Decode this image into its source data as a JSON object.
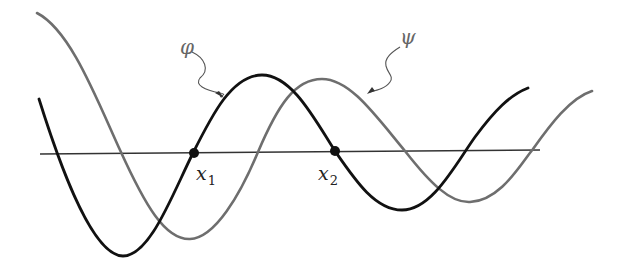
{
  "figure": {
    "colors": {
      "phi": "#111111",
      "psi": "#6e6e6e",
      "axis": "#333333",
      "background": "#ffffff"
    },
    "curves": [
      {
        "name": "phi",
        "label": "φ",
        "style": "solid dark"
      },
      {
        "name": "psi",
        "label": "ψ",
        "style": "solid gray"
      }
    ],
    "points": [
      {
        "name": "x1",
        "label": "x",
        "subscript": "1"
      },
      {
        "name": "x2",
        "label": "x",
        "subscript": "2"
      }
    ]
  }
}
